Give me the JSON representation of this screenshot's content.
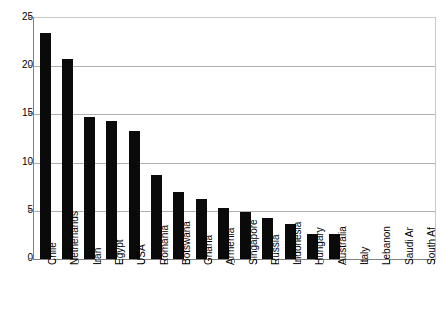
{
  "chart_data": {
    "type": "bar",
    "title": "",
    "subtitle": "",
    "xlabel": "",
    "ylabel": "",
    "ylim": [
      0,
      25
    ],
    "yticks": [
      0,
      5,
      10,
      15,
      20,
      25
    ],
    "grid": true,
    "legend": null,
    "bar_color": "#0a0a0a",
    "categories": [
      "Chile",
      "Netherlands",
      "Iran",
      "Egypt",
      "USA",
      "Romania",
      "Botswana",
      "Ghana",
      "Armenia",
      "Singapore",
      "Russia",
      "Indonesia",
      "Hungary",
      "Australia",
      "Italy",
      "Lebanon",
      "Saudi Ar",
      "South Af"
    ],
    "values": [
      23.4,
      20.7,
      14.7,
      14.3,
      13.3,
      8.7,
      7.0,
      6.2,
      5.3,
      4.9,
      4.3,
      3.6,
      2.6,
      2.6,
      0,
      0,
      0,
      0
    ]
  }
}
